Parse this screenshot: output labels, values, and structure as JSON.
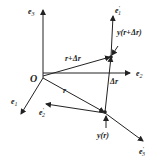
{
  "diagram": {
    "origin_label": "O",
    "axes": {
      "e1": {
        "label": "e",
        "sub": "1"
      },
      "e2": {
        "label": "e",
        "sub": "2"
      },
      "e3": {
        "label": "e",
        "sub": "3"
      }
    },
    "moving_frame": {
      "e1p": {
        "label": "e",
        "sub": "1",
        "prime": "′"
      },
      "e2p": {
        "label": "e",
        "sub": "2",
        "prime": "′"
      },
      "e3p": {
        "label": "e",
        "sub": "3",
        "prime": "′"
      }
    },
    "vectors": {
      "r": "r",
      "r_plus_dr": "r+Δr",
      "dr": "Δr"
    },
    "points": {
      "y_r": "y(r)",
      "y_r_dr": "y(r+Δr)"
    },
    "color": "#222222"
  }
}
